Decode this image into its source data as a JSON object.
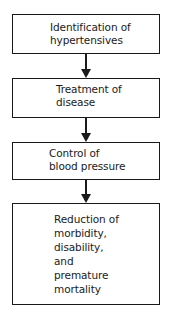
{
  "flowchart": {
    "steps": [
      {
        "lines": [
          "Identification of",
          "hypertensives"
        ]
      },
      {
        "lines": [
          "Treatment of",
          "disease"
        ]
      },
      {
        "lines": [
          "Control of",
          "blood pressure"
        ]
      },
      {
        "lines": [
          "Reduction of",
          "morbidity,",
          "disability,",
          "and",
          "premature",
          "mortality"
        ]
      }
    ],
    "connectors": [
      "step1-to-step2",
      "step2-to-step3",
      "step3-to-step4"
    ]
  }
}
